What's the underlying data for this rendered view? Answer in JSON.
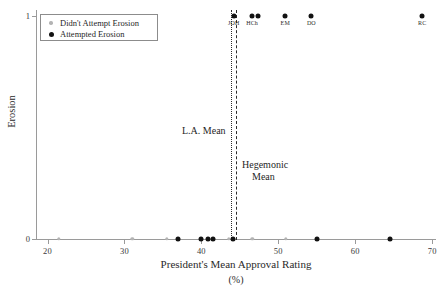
{
  "chart_data": {
    "type": "scatter",
    "title": "",
    "xlabel": "President's Mean Approval Rating",
    "xunits": "(%)",
    "ylabel": "Erosion",
    "xlim": [
      18.5,
      70.5
    ],
    "ylim": [
      -0.07,
      1.06
    ],
    "xticks": [
      20,
      30,
      40,
      50,
      60,
      70
    ],
    "yticks": [
      0,
      1
    ],
    "grid": false,
    "legend_position": "upper-left",
    "series": [
      {
        "name": "Didn't Attempt Erosion",
        "marker": "small-gray-dot",
        "color": "#b4b4b4",
        "points": [
          {
            "x": 21.5,
            "y": 0
          },
          {
            "x": 31.0,
            "y": 0
          },
          {
            "x": 35.5,
            "y": 0
          },
          {
            "x": 43.6,
            "y": 0
          },
          {
            "x": 46.6,
            "y": 0
          },
          {
            "x": 51.0,
            "y": 0
          }
        ]
      },
      {
        "name": "Attempted Erosion",
        "marker": "large-black-dot",
        "color": "#121212",
        "points": [
          {
            "x": 37.0,
            "y": 0,
            "label": ""
          },
          {
            "x": 40.0,
            "y": 0,
            "label": ""
          },
          {
            "x": 40.9,
            "y": 0,
            "label": ""
          },
          {
            "x": 41.5,
            "y": 0,
            "label": ""
          },
          {
            "x": 44.1,
            "y": 0,
            "label": ""
          },
          {
            "x": 55.0,
            "y": 0,
            "label": ""
          },
          {
            "x": 64.5,
            "y": 0,
            "label": ""
          },
          {
            "x": 44.2,
            "y": 1,
            "label": "JOH"
          },
          {
            "x": 46.6,
            "y": 1,
            "label": "HCh"
          },
          {
            "x": 47.4,
            "y": 1,
            "label": ""
          },
          {
            "x": 50.9,
            "y": 1,
            "label": "EM"
          },
          {
            "x": 54.3,
            "y": 1,
            "label": "DO"
          },
          {
            "x": 68.7,
            "y": 1,
            "label": "RC"
          }
        ]
      }
    ],
    "reference_lines": [
      {
        "name": "L.A. Mean",
        "label": "L.A. Mean",
        "x": 43.8,
        "style": "dotted",
        "color": "#2a2a2a"
      },
      {
        "name": "Hegemonic Mean",
        "label_line1": "Hegemonic",
        "label_line2": "Mean",
        "x": 44.5,
        "style": "dashed",
        "color": "#2a2a2a"
      }
    ]
  },
  "legend": {
    "items": [
      {
        "label": "Didn't Attempt Erosion",
        "marker": "gray-dot"
      },
      {
        "label": "Attempted Erosion",
        "marker": "black-dot"
      }
    ]
  },
  "axis_labels": {
    "x_title": "President's Mean Approval Rating",
    "x_units": "(%)",
    "y_title": "Erosion",
    "x_tick_labels": [
      "20",
      "30",
      "40",
      "50",
      "60",
      "70"
    ],
    "y_tick_labels": [
      "0",
      "1"
    ]
  },
  "annotations": {
    "la_mean": "L.A. Mean",
    "hegemonic_mean_line1": "Hegemonic",
    "hegemonic_mean_line2": "Mean"
  }
}
